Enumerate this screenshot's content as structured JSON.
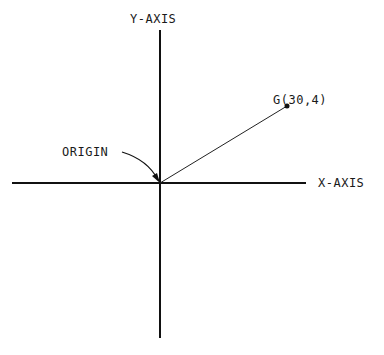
{
  "diagram": {
    "y_axis_label": "Y-AXIS",
    "x_axis_label": "X-AXIS",
    "origin_label": "ORIGIN",
    "point_label": "G(30,4)",
    "point": {
      "name": "G",
      "x": 30,
      "y": 4
    },
    "line_color": "#111111"
  }
}
